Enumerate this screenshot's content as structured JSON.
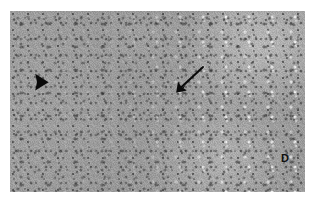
{
  "figure": {
    "type": "histology-micrograph",
    "modality": "light-microscopy",
    "stain_appearance": "grayscale",
    "caption": "",
    "canvas": {
      "width": 316,
      "height": 205,
      "background": "#ffffff"
    },
    "plate": {
      "left": 10,
      "top": 11,
      "width": 295,
      "height": 181,
      "base_color": "#9d9d9d",
      "description": "Uniform sheet of densely packed parenchymal cells with small dark nuclei; finer and more uniform at left, coarser with bright vacuolated spaces toward the right."
    }
  },
  "annotations": {
    "arrowhead": {
      "name": "arrowhead",
      "shape": "solid-triangle",
      "direction": "right",
      "color": "#0a0a0a",
      "x": 24,
      "y": 62,
      "width": 16,
      "height": 18
    },
    "arrow": {
      "name": "arrow",
      "shape": "line-with-solid-head",
      "direction": "down-left",
      "color": "#0a0a0a",
      "tail_x": 192,
      "tail_y": 56,
      "tip_x": 167,
      "tip_y": 80
    },
    "label_d": {
      "name": "region-label",
      "text": "D",
      "color": "#101010",
      "x": 271,
      "y": 141
    }
  },
  "colors": {
    "background": "#ffffff",
    "tissue_mid": "#9d9d9d",
    "tissue_light": "#d7d7d7",
    "tissue_dark": "#4a4a4a",
    "marker_black": "#0a0a0a"
  }
}
